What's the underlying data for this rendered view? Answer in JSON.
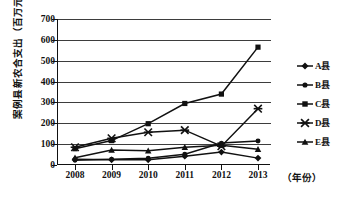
{
  "chart_data": {
    "type": "line",
    "title": "",
    "xlabel": "（年份）",
    "ylabel": "案例县新农合支出（百万元）",
    "categories": [
      "2008",
      "2009",
      "2010",
      "2011",
      "2012",
      "2013"
    ],
    "x": [
      2008,
      2009,
      2010,
      2011,
      2012,
      2013
    ],
    "ylim": [
      0,
      700
    ],
    "yticks": [
      0,
      100,
      200,
      300,
      400,
      500,
      600,
      700
    ],
    "ytick_labels": [
      "0",
      "100",
      "200",
      "300",
      "400",
      "500",
      "600",
      "700"
    ],
    "grid": true,
    "legend_position": "right",
    "series": [
      {
        "name": "A县",
        "marker": "diamond",
        "values": [
          28,
          25,
          25,
          42,
          62,
          33
        ]
      },
      {
        "name": "B县",
        "marker": "circle",
        "values": [
          23,
          28,
          32,
          52,
          105,
          115
        ]
      },
      {
        "name": "C县",
        "marker": "square",
        "values": [
          78,
          117,
          198,
          295,
          340,
          565
        ]
      },
      {
        "name": "D县",
        "marker": "cross",
        "values": [
          85,
          128,
          157,
          167,
          90,
          270
        ]
      },
      {
        "name": "E县",
        "marker": "triangle",
        "values": [
          35,
          72,
          68,
          85,
          95,
          75
        ]
      }
    ]
  },
  "legend": {
    "items": [
      {
        "label": "A县",
        "marker": "diamond"
      },
      {
        "label": "B县",
        "marker": "circle"
      },
      {
        "label": "C县",
        "marker": "square"
      },
      {
        "label": "D县",
        "marker": "cross"
      },
      {
        "label": "E县",
        "marker": "triangle"
      }
    ]
  },
  "axes": {
    "y_title": "案例县新农合支出（百万元）",
    "x_title": "（年份）"
  },
  "colors": {
    "line": "#111111",
    "grid": "#3d3d3d",
    "axis": "#111111",
    "background": "#ffffff"
  }
}
